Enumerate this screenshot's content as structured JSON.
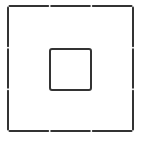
{
  "diagram": {
    "background": "#ffffff",
    "stroke_color": "#333333",
    "stroke_width": 2,
    "outer_square": {
      "x": 8,
      "y": 6,
      "size": 125,
      "segments_per_side": 3,
      "gap": 3
    },
    "inner_square": {
      "x": 50,
      "y": 49,
      "size": 41
    }
  }
}
